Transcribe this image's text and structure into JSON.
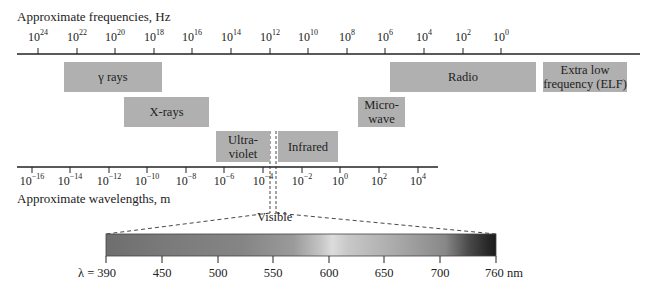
{
  "chart_data": {
    "type": "diagram",
    "frequency_axis": {
      "label": "Approximate frequencies, Hz",
      "ticks": [
        "10^24",
        "10^22",
        "10^20",
        "10^18",
        "10^16",
        "10^14",
        "10^12",
        "10^10",
        "10^8",
        "10^6",
        "10^4",
        "10^2",
        "10^0"
      ],
      "tick_bases": [
        "10",
        "10",
        "10",
        "10",
        "10",
        "10",
        "10",
        "10",
        "10",
        "10",
        "10",
        "10",
        "10"
      ],
      "tick_exponents": [
        "24",
        "22",
        "20",
        "18",
        "16",
        "14",
        "12",
        "10",
        "8",
        "6",
        "4",
        "2",
        "0"
      ],
      "tick_x": [
        38,
        77,
        115,
        154,
        192,
        231,
        270,
        308,
        347,
        385,
        424,
        463,
        501
      ]
    },
    "wavelength_axis": {
      "label": "Approximate wavelengths, m",
      "ticks": [
        "10^-16",
        "10^-14",
        "10^-12",
        "10^-10",
        "10^-8",
        "10^-6",
        "10^-4",
        "10^-2",
        "10^0",
        "10^2",
        "10^4"
      ],
      "tick_bases": [
        "10",
        "10",
        "10",
        "10",
        "10",
        "10",
        "10",
        "10",
        "10",
        "10",
        "10"
      ],
      "tick_exponents": [
        "−16",
        "−14",
        "−12",
        "−10",
        "−8",
        "−6",
        "−4",
        "−2",
        "0",
        "2",
        "4"
      ],
      "tick_x": [
        32,
        70,
        109,
        147,
        186,
        224,
        263,
        302,
        340,
        379,
        418
      ]
    },
    "bands": [
      {
        "name": "γ rays",
        "x": 64,
        "y": 62,
        "w": 98,
        "h": 30
      },
      {
        "name": "X-rays",
        "x": 124,
        "y": 97,
        "w": 85,
        "h": 30
      },
      {
        "name": "Ultra-\nviolet",
        "x": 216,
        "y": 131,
        "w": 54,
        "h": 31
      },
      {
        "name": "Infrared",
        "x": 278,
        "y": 131,
        "w": 60,
        "h": 31
      },
      {
        "name": "Micro-\nwave",
        "x": 358,
        "y": 97,
        "w": 47,
        "h": 30
      },
      {
        "name": "Radio",
        "x": 390,
        "y": 62,
        "w": 146,
        "h": 30
      },
      {
        "name": "Extra low\nfrequency (ELF)",
        "x": 543,
        "y": 62,
        "w": 84,
        "h": 30
      }
    ],
    "visible_label": "Visible",
    "visible_spectrum": {
      "ticks": [
        "λ = 390",
        "450",
        "500",
        "550",
        "600",
        "650",
        "700",
        "760 nm"
      ],
      "values_nm": [
        390,
        450,
        500,
        550,
        600,
        650,
        700,
        760
      ],
      "tick_x": [
        106,
        162,
        218,
        273,
        329,
        384,
        440,
        496
      ]
    }
  },
  "colors": {
    "band_fill": "#b0b0b0",
    "axis": "#222222"
  }
}
